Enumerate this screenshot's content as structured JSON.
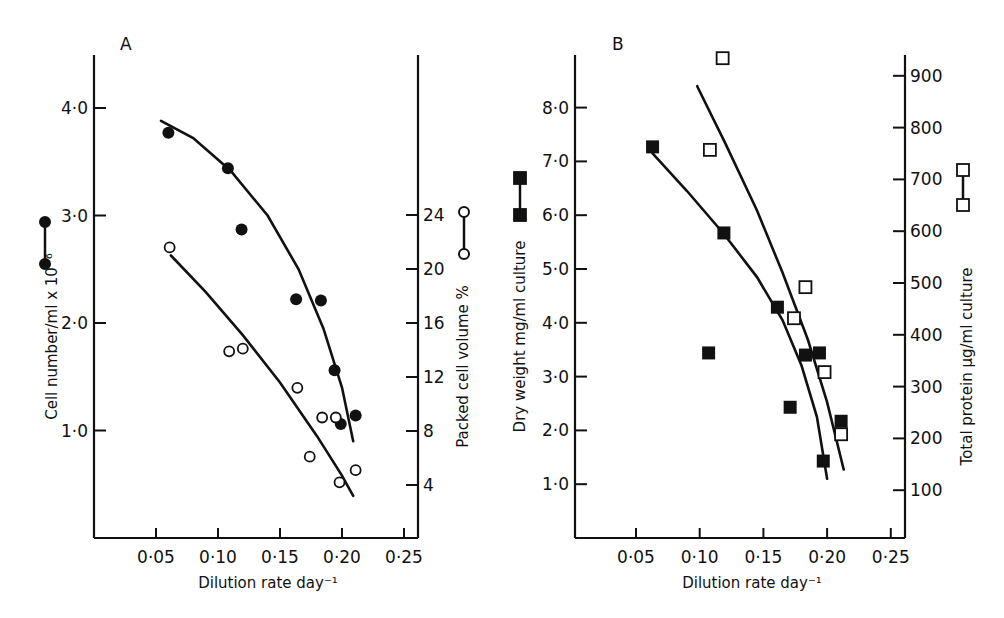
{
  "chart_data": [
    {
      "panel": "A",
      "type": "scatter",
      "title": "",
      "xlabel": "Dilution rate day⁻¹",
      "ylabel": "Cell number/ml x 10⁻⁶",
      "y2label": "Packed cell volume %",
      "xlim": [
        0,
        0.25
      ],
      "ylim": [
        0,
        4.4
      ],
      "y2lim": [
        0,
        28
      ],
      "x_ticks": [
        "0·05",
        "0·10",
        "0·15",
        "0·20",
        "0·25"
      ],
      "y_ticks": [
        "1·0",
        "2·0",
        "3·0",
        "4·0"
      ],
      "y2_ticks": [
        "4",
        "8",
        "12",
        "16",
        "20",
        "24"
      ],
      "grid": false,
      "series": [
        {
          "name": "Cell number (filled circles)",
          "marker": "filled-circle",
          "axis": "left",
          "x": [
            0.06,
            0.108,
            0.119,
            0.163,
            0.183,
            0.194,
            0.199,
            0.211
          ],
          "y": [
            3.77,
            3.44,
            2.87,
            2.22,
            2.21,
            1.56,
            1.06,
            1.14
          ],
          "fit_x": [
            0.054,
            0.08,
            0.11,
            0.14,
            0.165,
            0.185,
            0.2,
            0.209
          ],
          "fit_y": [
            3.88,
            3.72,
            3.42,
            3.0,
            2.5,
            1.95,
            1.4,
            0.9
          ]
        },
        {
          "name": "Packed cell volume (open circles)",
          "marker": "open-circle",
          "axis": "right",
          "x": [
            0.061,
            0.109,
            0.12,
            0.164,
            0.184,
            0.195,
            0.174,
            0.198,
            0.211
          ],
          "y": [
            21.6,
            13.9,
            14.1,
            11.2,
            9.0,
            9.0,
            6.1,
            4.2,
            5.1
          ],
          "fit_x": [
            0.062,
            0.09,
            0.12,
            0.15,
            0.18,
            0.2,
            0.209
          ],
          "fit_y": [
            21.0,
            18.3,
            15.1,
            11.6,
            7.6,
            4.7,
            3.2
          ]
        }
      ]
    },
    {
      "panel": "B",
      "type": "scatter",
      "title": "",
      "xlabel": "Dilution rate day⁻¹",
      "ylabel": "Dry weight mg/ml culture",
      "y2label": "Total protein μg/ml culture",
      "xlim": [
        0,
        0.25
      ],
      "ylim": [
        0,
        8.8
      ],
      "y2lim": [
        0,
        950
      ],
      "x_ticks": [
        "0·05",
        "0·10",
        "0·15",
        "0·20",
        "0·25"
      ],
      "y_ticks": [
        "1·0",
        "2·0",
        "3·0",
        "4·0",
        "5·0",
        "6·0",
        "7·0",
        "8·0"
      ],
      "y2_ticks": [
        "100",
        "200",
        "300",
        "400",
        "500",
        "600",
        "700",
        "800",
        "900"
      ],
      "grid": false,
      "series": [
        {
          "name": "Dry weight (filled squares)",
          "marker": "filled-square",
          "axis": "left",
          "x": [
            0.063,
            0.107,
            0.119,
            0.161,
            0.171,
            0.183,
            0.194,
            0.197,
            0.211
          ],
          "y": [
            7.27,
            3.44,
            5.67,
            4.29,
            2.43,
            3.4,
            3.44,
            1.43,
            2.17
          ],
          "fit_x": [
            0.063,
            0.09,
            0.119,
            0.145,
            0.165,
            0.18,
            0.192,
            0.2
          ],
          "fit_y": [
            7.15,
            6.45,
            5.65,
            4.85,
            4.05,
            3.2,
            2.25,
            1.1
          ]
        },
        {
          "name": "Total protein (open squares)",
          "marker": "open-square",
          "axis": "right",
          "x": [
            0.108,
            0.118,
            0.174,
            0.183,
            0.198,
            0.211
          ],
          "y": [
            757,
            934,
            432,
            492,
            328,
            208
          ],
          "fit_x": [
            0.098,
            0.12,
            0.145,
            0.165,
            0.185,
            0.2,
            0.213
          ],
          "fit_y": [
            880,
            770,
            640,
            520,
            390,
            270,
            140
          ]
        }
      ]
    }
  ],
  "panels": {
    "a_label": "A",
    "b_label": "B"
  }
}
